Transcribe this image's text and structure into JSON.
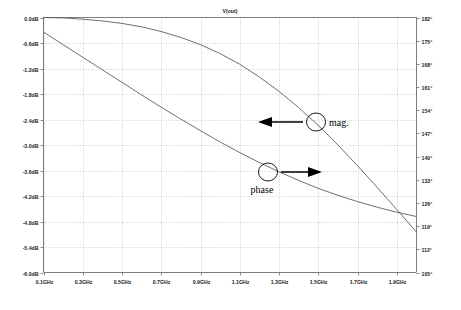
{
  "chart_data": {
    "type": "line",
    "title": "V(out)",
    "xlabel": "",
    "ylabel": "",
    "grid": true,
    "legend_position": "inline-annotations",
    "xlim": [
      0.1,
      2.0
    ],
    "x_ticks": [
      "0.1GHz",
      "0.3GHz",
      "0.5GHz",
      "0.7GHz",
      "0.9GHz",
      "1.1GHz",
      "1.3GHz",
      "1.5GHz",
      "1.7GHz",
      "1.9GHz"
    ],
    "x_tick_values": [
      0.1,
      0.3,
      0.5,
      0.7,
      0.9,
      1.1,
      1.3,
      1.5,
      1.7,
      1.9
    ],
    "left_axis": {
      "unit": "dB",
      "ylim": [
        -6.0,
        0.0
      ],
      "ticks": [
        "0.0dB",
        "-0.6dB",
        "-1.2dB",
        "-1.8dB",
        "-2.4dB",
        "-3.0dB",
        "-3.6dB",
        "-4.2dB",
        "-4.8dB",
        "-5.4dB",
        "-6.0dB"
      ],
      "tick_values": [
        0.0,
        -0.6,
        -1.2,
        -1.8,
        -2.4,
        -3.0,
        -3.6,
        -4.2,
        -4.8,
        -5.4,
        -6.0
      ]
    },
    "right_axis": {
      "unit": "degrees",
      "ylim": [
        105,
        182
      ],
      "ticks": [
        "182°",
        "175°",
        "168°",
        "161°",
        "154°",
        "147°",
        "140°",
        "133°",
        "126°",
        "119°",
        "112°",
        "105°"
      ],
      "tick_values": [
        182,
        175,
        168,
        161,
        154,
        147,
        140,
        133,
        126,
        119,
        112,
        105
      ]
    },
    "series": [
      {
        "name": "mag.",
        "axis": "left",
        "unit": "dB",
        "x": [
          0.1,
          0.2,
          0.3,
          0.4,
          0.5,
          0.6,
          0.7,
          0.8,
          0.9,
          1.0,
          1.1,
          1.2,
          1.3,
          1.4,
          1.5,
          1.6,
          1.7,
          1.8,
          1.9,
          2.0
        ],
        "values": [
          0.0,
          -0.01,
          -0.04,
          -0.08,
          -0.14,
          -0.22,
          -0.33,
          -0.47,
          -0.64,
          -0.85,
          -1.1,
          -1.4,
          -1.74,
          -2.12,
          -2.54,
          -3.0,
          -3.49,
          -4.0,
          -4.52,
          -5.05
        ]
      },
      {
        "name": "phase",
        "axis": "right",
        "unit": "degrees",
        "x": [
          0.1,
          0.2,
          0.3,
          0.4,
          0.5,
          0.6,
          0.7,
          0.8,
          0.9,
          1.0,
          1.1,
          1.2,
          1.3,
          1.4,
          1.5,
          1.6,
          1.7,
          1.8,
          1.9,
          2.0
        ],
        "values": [
          177.6,
          173.8,
          170.0,
          166.2,
          162.4,
          158.6,
          154.9,
          151.3,
          147.8,
          144.4,
          141.2,
          138.2,
          135.4,
          132.8,
          130.4,
          128.3,
          126.4,
          124.7,
          123.2,
          121.9
        ]
      }
    ],
    "annotations": [
      {
        "label": "mag.",
        "marker": "ellipse",
        "arrow_direction": "left",
        "points_to_series": "mag."
      },
      {
        "label": "phase",
        "marker": "ellipse",
        "arrow_direction": "right",
        "points_to_series": "phase"
      }
    ]
  },
  "colors": {
    "background": "#ffffff",
    "grid": "#9a9a9a",
    "axis": "#7d7d7d",
    "trace": "#555555",
    "annotation": "#000000"
  }
}
